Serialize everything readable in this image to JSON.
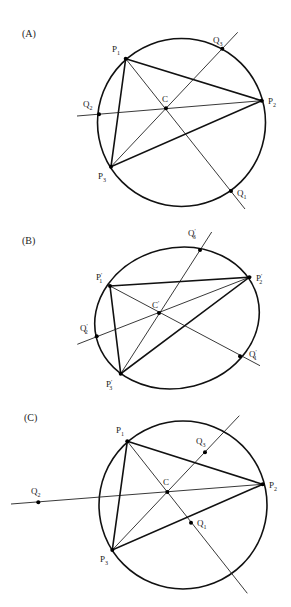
{
  "panels": [
    {
      "id": "A",
      "label": "(A)",
      "label_pos": [
        22,
        37
      ],
      "shape": {
        "type": "circle",
        "cx": 181.5,
        "cy": 122.5,
        "r": 84
      },
      "points": {
        "P1": {
          "x": 125.7,
          "y": 58.7,
          "name": "P",
          "sub": "1",
          "prime": "",
          "lx": 112,
          "ly": 52
        },
        "P2": {
          "x": 261.7,
          "y": 100.7,
          "name": "P",
          "sub": "2",
          "prime": "",
          "lx": 268,
          "ly": 104
        },
        "P3": {
          "x": 111,
          "y": 166.7,
          "name": "P",
          "sub": "3",
          "prime": "",
          "lx": 98,
          "ly": 179
        },
        "C": {
          "x": 166,
          "y": 108.3,
          "name": "C",
          "sub": "",
          "prime": "",
          "lx": 162,
          "ly": 102
        },
        "Q1": {
          "x": 231,
          "y": 191,
          "name": "Q",
          "sub": "1",
          "prime": "",
          "lx": 237,
          "ly": 196
        },
        "Q2": {
          "x": 99,
          "y": 114.3,
          "name": "Q",
          "sub": "2",
          "prime": "",
          "lx": 83,
          "ly": 107
        },
        "Q3": {
          "x": 222.3,
          "y": 48.7,
          "name": "Q",
          "sub": "3",
          "prime": "",
          "lx": 213,
          "ly": 43
        }
      },
      "lines": [
        {
          "from": [
            125.7,
            58.7
          ],
          "to": [
            245,
            209
          ]
        },
        {
          "from": [
            77,
            116
          ],
          "to": [
            261.7,
            100.7
          ]
        },
        {
          "from": [
            111,
            166.7
          ],
          "to": [
            237.7,
            32.3
          ]
        }
      ]
    },
    {
      "id": "B",
      "label": "(B)",
      "label_pos": [
        22,
        244
      ],
      "shape": {
        "type": "ellipse",
        "cx": 177,
        "cy": 318,
        "rx": 83,
        "ry": 70,
        "rotate": -14
      },
      "points": {
        "P1": {
          "x": 110,
          "y": 286,
          "name": "P",
          "sub": "1",
          "prime": "′",
          "lx": 96,
          "ly": 280
        },
        "P2": {
          "x": 249.3,
          "y": 277.3,
          "name": "P",
          "sub": "2",
          "prime": "′",
          "lx": 256,
          "ly": 281
        },
        "P3": {
          "x": 120.7,
          "y": 373.7,
          "name": "P",
          "sub": "3",
          "prime": "′",
          "lx": 106,
          "ly": 387
        },
        "C": {
          "x": 159,
          "y": 313,
          "name": "C",
          "sub": "",
          "prime": "′",
          "lx": 152,
          "ly": 308
        },
        "Q1": {
          "x": 240,
          "y": 356.3,
          "name": "Q",
          "sub": "1",
          "prime": "′",
          "lx": 249,
          "ly": 357
        },
        "Q2": {
          "x": 96.7,
          "y": 336.3,
          "name": "Q",
          "sub": "2",
          "prime": "′",
          "lx": 80,
          "ly": 331
        },
        "Q3": {
          "x": 200,
          "y": 250,
          "name": "Q",
          "sub": "3",
          "prime": "′",
          "lx": 188,
          "ly": 236
        }
      },
      "lines": [
        {
          "from": [
            110,
            286
          ],
          "to": [
            260,
            365.7
          ]
        },
        {
          "from": [
            77.3,
            344.3
          ],
          "to": [
            249.3,
            277.3
          ]
        },
        {
          "from": [
            120.7,
            373.7
          ],
          "to": [
            211.7,
            232
          ]
        }
      ]
    },
    {
      "id": "C",
      "label": "(C)",
      "label_pos": [
        24,
        421
      ],
      "shape": {
        "type": "circle",
        "cx": 183,
        "cy": 505,
        "r": 84
      },
      "points": {
        "P1": {
          "x": 127.3,
          "y": 441.3,
          "name": "P",
          "sub": "1",
          "prime": "",
          "lx": 116,
          "ly": 433
        },
        "P2": {
          "x": 262.7,
          "y": 484.3,
          "name": "P",
          "sub": "2",
          "prime": "",
          "lx": 269,
          "ly": 488
        },
        "P3": {
          "x": 112.3,
          "y": 550,
          "name": "P",
          "sub": "3",
          "prime": "",
          "lx": 100,
          "ly": 562
        },
        "C": {
          "x": 167.3,
          "y": 492,
          "name": "C",
          "sub": "",
          "prime": "",
          "lx": 163,
          "ly": 485
        },
        "Q1": {
          "x": 191,
          "y": 522.7,
          "name": "Q",
          "sub": "1",
          "prime": "",
          "lx": 197,
          "ly": 526
        },
        "Q2": {
          "x": 38.3,
          "y": 502.3,
          "name": "Q",
          "sub": "2",
          "prime": "",
          "lx": 31,
          "ly": 494
        },
        "Q3": {
          "x": 205,
          "y": 452.3,
          "name": "Q",
          "sub": "3",
          "prime": "",
          "lx": 196,
          "ly": 444
        }
      },
      "lines": [
        {
          "from": [
            127.3,
            441.3
          ],
          "to": [
            247.3,
            593.3
          ]
        },
        {
          "from": [
            11,
            504
          ],
          "to": [
            262.7,
            484.3
          ]
        },
        {
          "from": [
            112.3,
            550
          ],
          "to": [
            239.3,
            415.7
          ]
        }
      ]
    }
  ],
  "triangle_order": [
    "P1",
    "P2",
    "P3"
  ],
  "point_order": [
    "P1",
    "P2",
    "P3",
    "C",
    "Q1",
    "Q2",
    "Q3"
  ],
  "colors": {
    "ink": "#111111",
    "background": "#ffffff"
  }
}
